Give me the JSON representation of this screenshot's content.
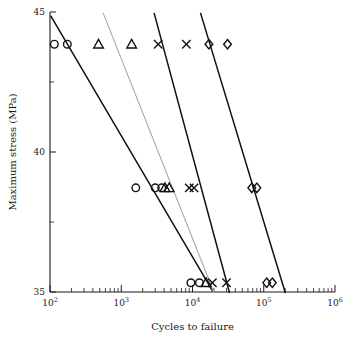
{
  "chart_data": {
    "type": "scatter",
    "title": "",
    "xlabel": "Cycles to failure",
    "ylabel": "Maximum stress (MPa)",
    "xscale": "log",
    "yscale": "linear",
    "xlim": [
      100,
      1000000
    ],
    "ylim": [
      35,
      45
    ],
    "grid": false,
    "legend": "none",
    "xticks": [
      {
        "value": 100,
        "label": "10",
        "exponent": "2"
      },
      {
        "value": 1000,
        "label": "10",
        "exponent": "3"
      },
      {
        "value": 10000,
        "label": "10",
        "exponent": "4"
      },
      {
        "value": 100000,
        "label": "10",
        "exponent": "5"
      },
      {
        "value": 1000000,
        "label": "10",
        "exponent": "6"
      }
    ],
    "yticks": [
      {
        "value": 45,
        "label": "45",
        "major": true
      },
      {
        "value": 42.5,
        "label": "",
        "major": false
      },
      {
        "value": 40,
        "label": "40",
        "major": true
      },
      {
        "value": 37.5,
        "label": "",
        "major": false
      },
      {
        "value": 35,
        "label": "35",
        "major": true
      }
    ],
    "series": [
      {
        "name": "circle-series",
        "marker": "circle",
        "points": [
          {
            "x": 115,
            "y": 43.85
          },
          {
            "x": 175,
            "y": 43.85
          },
          {
            "x": 1600,
            "y": 38.72
          },
          {
            "x": 3000,
            "y": 38.72
          },
          {
            "x": 3700,
            "y": 38.72
          },
          {
            "x": 9500,
            "y": 35.33
          },
          {
            "x": 12500,
            "y": 35.33
          }
        ]
      },
      {
        "name": "triangle-series",
        "marker": "triangle",
        "points": [
          {
            "x": 480,
            "y": 43.85
          },
          {
            "x": 1400,
            "y": 43.85
          },
          {
            "x": 4100,
            "y": 38.72
          },
          {
            "x": 4700,
            "y": 38.72
          },
          {
            "x": 15500,
            "y": 35.33
          }
        ]
      },
      {
        "name": "cross-series",
        "marker": "cross",
        "points": [
          {
            "x": 3300,
            "y": 43.85
          },
          {
            "x": 8200,
            "y": 43.85
          },
          {
            "x": 9000,
            "y": 38.72
          },
          {
            "x": 10500,
            "y": 38.72
          },
          {
            "x": 19000,
            "y": 35.33
          },
          {
            "x": 30000,
            "y": 35.33
          }
        ]
      },
      {
        "name": "diamond-series",
        "marker": "diamond",
        "points": [
          {
            "x": 17000,
            "y": 43.85
          },
          {
            "x": 31000,
            "y": 43.85
          },
          {
            "x": 68000,
            "y": 38.72
          },
          {
            "x": 80000,
            "y": 38.72
          },
          {
            "x": 110000,
            "y": 35.33
          },
          {
            "x": 132000,
            "y": 35.33
          }
        ]
      }
    ],
    "trendlines": [
      {
        "name": "trendline-1",
        "style": "solid",
        "x1": 103,
        "y1": 44.85,
        "x2": 19000,
        "y2": 35.05
      },
      {
        "name": "trendline-2",
        "style": "faint",
        "x1": 560,
        "y1": 44.95,
        "x2": 20000,
        "y2": 34.98
      },
      {
        "name": "trendline-3",
        "style": "solid",
        "x1": 2900,
        "y1": 44.95,
        "x2": 33000,
        "y2": 34.98
      },
      {
        "name": "trendline-4",
        "style": "solid",
        "x1": 13000,
        "y1": 44.95,
        "x2": 200000,
        "y2": 34.98
      }
    ]
  }
}
